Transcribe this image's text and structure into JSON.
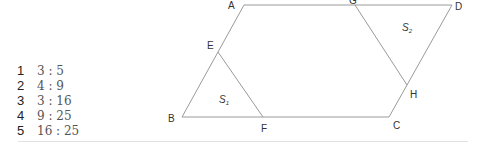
{
  "choices": [
    {
      "number": "1",
      "value": "3 : 5"
    },
    {
      "number": "2",
      "value": "4 : 9"
    },
    {
      "number": "3",
      "value": "3 : 16"
    },
    {
      "number": "4",
      "value": "9 : 25"
    },
    {
      "number": "5",
      "value": "16 : 25"
    }
  ],
  "figure": {
    "points": {
      "A": "A",
      "B": "B",
      "C": "C",
      "D": "D",
      "E": "E",
      "F": "F",
      "G": "G",
      "H": "H"
    },
    "areas": {
      "s1": "S",
      "s1_sub": "1",
      "s2": "S",
      "s2_sub": "2"
    },
    "line_color": "#9a9a9a"
  }
}
